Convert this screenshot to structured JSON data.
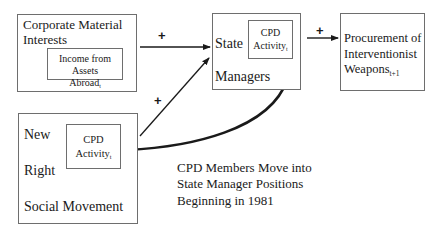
{
  "nodes": {
    "corporate": {
      "title_line1": "Corporate Material",
      "title_line2": "Interests",
      "inner_line1": "Income from Assets",
      "inner_line2": "Abroad",
      "inner_sub": "t"
    },
    "state": {
      "title_line1": "State",
      "title_line2": "Managers",
      "inner_line1": "CPD",
      "inner_line2": "Activity",
      "inner_sub": "t"
    },
    "procurement": {
      "line1": "Procurement of",
      "line2": "Interventionist",
      "line3": "Weapons",
      "line3_sub": "t+1"
    },
    "new_right": {
      "line1": "New",
      "line2": "Right",
      "line3": "Social Movement",
      "inner_line1": "CPD",
      "inner_line2": "Activity",
      "inner_sub": "t"
    }
  },
  "edges": [
    {
      "from": "Corporate Material Interests",
      "to": "State Managers",
      "sign": "+"
    },
    {
      "from": "New Right Social Movement",
      "to": "State Managers",
      "sign": "+"
    },
    {
      "from": "State Managers",
      "to": "Procurement of Interventionist Weapons",
      "sign": "+"
    },
    {
      "from": "New Right CPD Activity",
      "to": "State Managers",
      "sign": "",
      "style": "curved-bold"
    }
  ],
  "annotation": {
    "line1": "CPD Members Move into",
    "line2": "State Manager Positions",
    "line3": "Beginning in 1981"
  },
  "signs": {
    "corp_to_state": "+",
    "newright_to_state": "+",
    "state_to_proc": "+"
  }
}
